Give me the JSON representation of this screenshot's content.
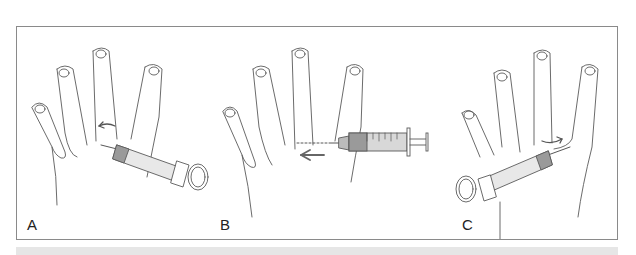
{
  "figure": {
    "panels": [
      {
        "label": "A",
        "description": "Syringe inserted at web space of hand, angled from lower right, curved arrow indicating rotation"
      },
      {
        "label": "B",
        "description": "Syringe inserted horizontally from the right, dotted needle path and arrow pointing left"
      },
      {
        "label": "C",
        "description": "Syringe inserted from lower left, curved arrow indicating rotation"
      }
    ]
  },
  "colors": {
    "line": "#5a5a5a",
    "frame": "#8a8a8a",
    "syringe_shade": "#9a9a9a",
    "arrow": "#6a6a6a",
    "strip": "#e6e6e6"
  }
}
